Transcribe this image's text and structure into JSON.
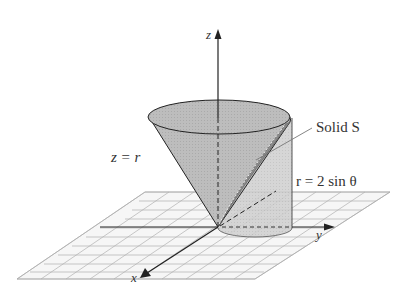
{
  "figure": {
    "axes": {
      "x_label": "x",
      "y_label": "y",
      "z_label": "z"
    },
    "labels": {
      "cone": "z = r",
      "cylinder": "r = 2 sin θ",
      "solid": "Solid S"
    },
    "colors": {
      "surface_fill": "#b8b8b8",
      "cylinder_fill": "#c8c8c8",
      "solid_strip": "#909090",
      "grid_line": "#a0a0a0",
      "grid_fill": "#f4f4f4",
      "axis": "#222222",
      "text": "#333333"
    }
  }
}
